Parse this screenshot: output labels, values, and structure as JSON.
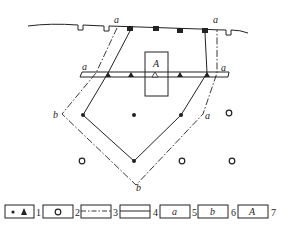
{
  "labels": {
    "a_top_left": "a",
    "a_top_right": "a",
    "a_bar_left": "a",
    "a_bar_right": "a",
    "a_side_right": "a",
    "b_side_left": "b",
    "b_bottom": "b",
    "box": "A"
  },
  "legend": [
    {
      "number": "1",
      "symbol": "dot-and-triangle",
      "text": ""
    },
    {
      "number": "2",
      "symbol": "open-circle",
      "text": ""
    },
    {
      "number": "3",
      "symbol": "dash-dot-line",
      "text": ""
    },
    {
      "number": "4",
      "symbol": "double-line",
      "text": ""
    },
    {
      "number": "5",
      "symbol": "text",
      "text": "a"
    },
    {
      "number": "6",
      "symbol": "text",
      "text": "b"
    },
    {
      "number": "7",
      "symbol": "text",
      "text": "A"
    }
  ],
  "colors": {
    "line": "#222222",
    "background": "#ffffff"
  }
}
